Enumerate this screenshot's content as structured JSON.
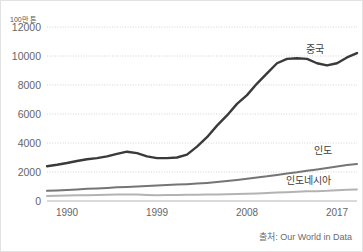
{
  "chart_data": {
    "type": "line",
    "title": "",
    "subtitle": "",
    "xlabel": "",
    "ylabel": "100만 톤",
    "unit_label": "100만 톤",
    "source": "출처: Our World in Data",
    "grid": true,
    "grid_style": "dotted-horizontal",
    "legend_position": "inline-right-end-labels",
    "xlim": [
      1988,
      2019
    ],
    "ylim": [
      0,
      12000
    ],
    "yticks": [
      0,
      2000,
      4000,
      6000,
      8000,
      10000,
      12000
    ],
    "ytick_labels": [
      "0",
      "2000",
      "4000",
      "6000",
      "8000",
      "10000",
      "12000"
    ],
    "xticks": [
      1990,
      1999,
      2008,
      2017
    ],
    "xtick_labels": [
      "1990",
      "1999",
      "2008",
      "2017"
    ],
    "x": [
      1988,
      1989,
      1990,
      1991,
      1992,
      1993,
      1994,
      1995,
      1996,
      1997,
      1998,
      1999,
      2000,
      2001,
      2002,
      2003,
      2004,
      2005,
      2006,
      2007,
      2008,
      2009,
      2010,
      2011,
      2012,
      2013,
      2014,
      2015,
      2016,
      2017,
      2018,
      2019
    ],
    "series": [
      {
        "name": "중국",
        "label": "중국",
        "color": "#3a3a3a",
        "stroke_width": 2.4,
        "values": [
          2400,
          2500,
          2620,
          2760,
          2880,
          2960,
          3080,
          3250,
          3400,
          3300,
          3080,
          2960,
          2960,
          3000,
          3200,
          3750,
          4400,
          5200,
          5900,
          6700,
          7300,
          8100,
          8800,
          9500,
          9800,
          9850,
          9800,
          9500,
          9350,
          9500,
          9900,
          10200
        ]
      },
      {
        "name": "인도",
        "label": "인도",
        "color": "#757575",
        "stroke_width": 2.0,
        "values": [
          700,
          730,
          760,
          800,
          840,
          870,
          900,
          940,
          970,
          1000,
          1030,
          1070,
          1100,
          1130,
          1160,
          1200,
          1250,
          1310,
          1380,
          1450,
          1530,
          1620,
          1700,
          1800,
          1900,
          1980,
          2080,
          2180,
          2280,
          2380,
          2480,
          2550
        ]
      },
      {
        "name": "인도네시아",
        "label": "인도네시아",
        "color": "#b3b3b3",
        "stroke_width": 2.0,
        "values": [
          350,
          360,
          375,
          390,
          400,
          415,
          430,
          445,
          455,
          450,
          420,
          400,
          410,
          420,
          425,
          430,
          440,
          450,
          465,
          480,
          500,
          525,
          550,
          580,
          610,
          640,
          670,
          680,
          700,
          740,
          780,
          800
        ]
      }
    ],
    "series_label_positions": [
      {
        "name": "중국",
        "x": 305,
        "y": 52
      },
      {
        "name": "인도",
        "x": 313,
        "y": 153
      },
      {
        "name": "인도네시아",
        "x": 285,
        "y": 183
      }
    ]
  }
}
